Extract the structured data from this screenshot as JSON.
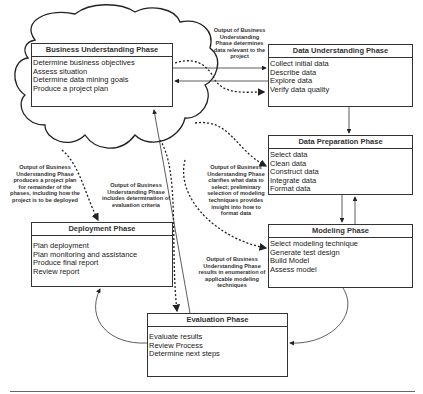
{
  "phases": {
    "business": {
      "title": "Business Understanding Phase",
      "items": [
        "Determine business objectives",
        "Assess situation",
        "Determine data mining goals",
        "Produce a project plan"
      ]
    },
    "data_understanding": {
      "title": "Data Understanding Phase",
      "items": [
        "Collect initial data",
        "Describe data",
        "Explore data",
        "Verify data quality"
      ]
    },
    "data_preparation": {
      "title": "Data Preparation Phase",
      "items": [
        "Select data",
        "Clean data",
        "Construct data",
        "Integrate data",
        "Format data"
      ]
    },
    "modeling": {
      "title": "Modeling Phase",
      "items": [
        "Select modeling technique",
        "Generate test design",
        "Build Model",
        "Assess model"
      ]
    },
    "deployment": {
      "title": "Deployment Phase",
      "items": [
        "Plan deployment",
        "Plan monitoring and assistance",
        "Produce final report",
        "Review report"
      ]
    },
    "evaluation": {
      "title": "Evaluation Phase",
      "items": [
        "Evaluate results",
        "Review Process",
        "Determine next steps"
      ]
    }
  },
  "annotations": {
    "to_data_understanding": "Output of Business Understanding Phase determines data relevant to the project",
    "to_data_preparation": "Output of Business Understanding Phase clarifies what data to select; preliminary selection of modeling techniques provides insight into how to format data",
    "to_deployment": "Output of Business Understanding Phase produces a project plan for remainder of the phases, including how the project is to be deployed",
    "to_evaluation": "Output of Business Understanding Phase includes determination of evaluation criteria",
    "to_modeling": "Output of Business Understanding Phase results in enumeration of applicable modeling techniques"
  }
}
